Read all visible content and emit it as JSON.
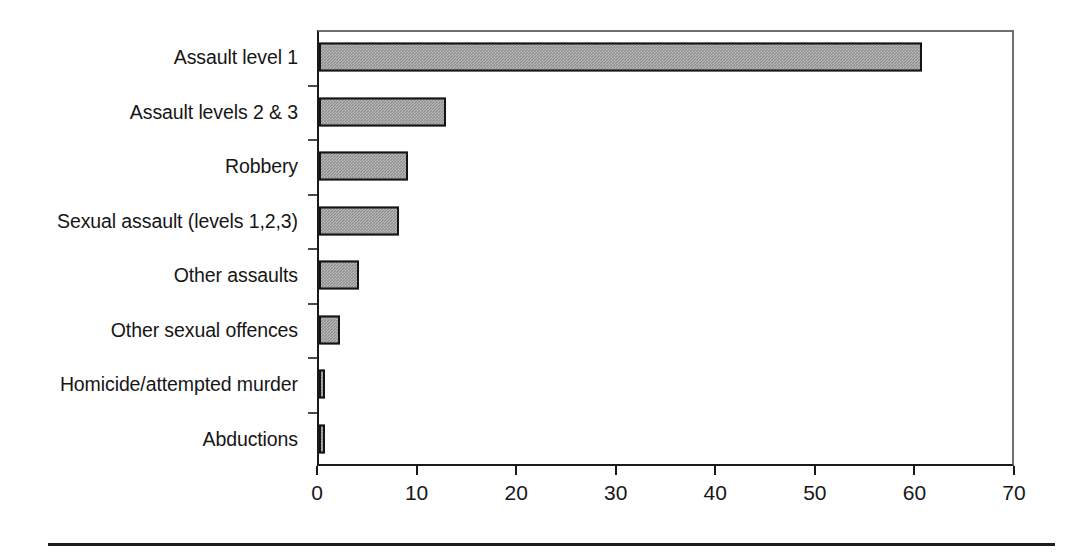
{
  "chart_data": {
    "type": "bar",
    "orientation": "horizontal",
    "title": "",
    "subtitle": "",
    "xlabel": "",
    "ylabel": "",
    "categories": [
      "Assault level 1",
      "Assault levels 2 & 3",
      "Robbery",
      "Sexual assault (levels 1,2,3)",
      "Other assaults",
      "Other sexual offences",
      "Homicide/attempted murder",
      "Abductions"
    ],
    "values": [
      60.6,
      12.8,
      8.9,
      8.0,
      4.0,
      2.1,
      0.5,
      0.5
    ],
    "xlim": [
      0,
      70
    ],
    "xticks": [
      0,
      10,
      20,
      30,
      40,
      50,
      60,
      70
    ],
    "xtick_labels": [
      "0",
      "10",
      "20",
      "30",
      "40",
      "50",
      "60",
      "70"
    ],
    "grid": false,
    "legend": null,
    "legend_position": "none",
    "annotations": [],
    "colors": {
      "bar_fill": "#8d8d8d",
      "bar_border": "#141414",
      "axis": "#1a1a1a",
      "frame": "#6f6f6f",
      "text": "#161616",
      "background": "#ffffff",
      "rule": "#1d1d1d"
    }
  }
}
